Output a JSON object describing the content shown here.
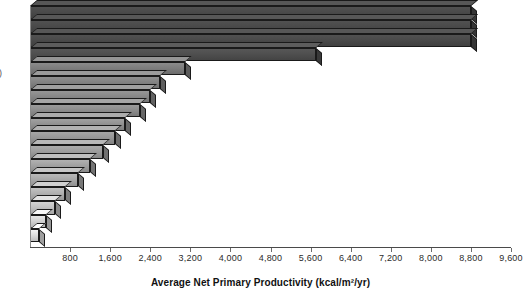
{
  "chart": {
    "type": "bar",
    "orientation": "horizontal",
    "title": "",
    "xlabel": "Average Net Primary Productivity (kcal/m²/yr)",
    "ylabel": "",
    "y_axis_label_cropped": ")",
    "xlim": [
      0,
      9600
    ],
    "xtick_step": 800,
    "grid": false,
    "legend": null
  },
  "chart_data": {
    "type": "bar",
    "orientation": "horizontal",
    "title": "",
    "xlabel": "Average Net Primary Productivity (kcal/m²/yr)",
    "ylabel": "",
    "xlim": [
      0,
      9600
    ],
    "ylim": null,
    "grid": false,
    "legend_position": "none",
    "tick_labels": [
      "800",
      "1,600",
      "2,400",
      "3,200",
      "4,000",
      "4,800",
      "5,600",
      "6,400",
      "7,200",
      "8,000",
      "8,800",
      "9,600"
    ],
    "tick_values": [
      800,
      1600,
      2400,
      3200,
      4000,
      4800,
      5600,
      6400,
      7200,
      8000,
      8800,
      9600
    ],
    "categories": [
      "",
      "",
      "",
      "",
      "",
      "",
      "",
      "",
      "",
      "",
      "",
      "",
      "",
      "",
      "",
      "",
      ""
    ],
    "values": [
      8800,
      8800,
      8800,
      5700,
      3100,
      2600,
      2400,
      2200,
      1900,
      1700,
      1450,
      1200,
      950,
      700,
      500,
      320,
      180
    ],
    "colors": [
      "#4a4a4a",
      "#4a4a4a",
      "#4a4a4a",
      "#4f4f4f",
      "#7e7e7e",
      "#838383",
      "#888888",
      "#8d8d8d",
      "#929292",
      "#979797",
      "#9c9c9c",
      "#a1a1a1",
      "#a8a8a8",
      "#b0b0b0",
      "#c0c0c0",
      "#d2d2d2",
      "#dedede"
    ],
    "bars": [
      {
        "index": 1,
        "value": 8800,
        "color": "#4a4a4a"
      },
      {
        "index": 2,
        "value": 8800,
        "color": "#4a4a4a"
      },
      {
        "index": 3,
        "value": 8800,
        "color": "#4a4a4a"
      },
      {
        "index": 4,
        "value": 5700,
        "color": "#4f4f4f"
      },
      {
        "index": 5,
        "value": 3100,
        "color": "#7e7e7e"
      },
      {
        "index": 6,
        "value": 2600,
        "color": "#838383"
      },
      {
        "index": 7,
        "value": 2400,
        "color": "#888888"
      },
      {
        "index": 8,
        "value": 2200,
        "color": "#8d8d8d"
      },
      {
        "index": 9,
        "value": 1900,
        "color": "#929292"
      },
      {
        "index": 10,
        "value": 1700,
        "color": "#979797"
      },
      {
        "index": 11,
        "value": 1450,
        "color": "#9c9c9c"
      },
      {
        "index": 12,
        "value": 1200,
        "color": "#a1a1a1"
      },
      {
        "index": 13,
        "value": 950,
        "color": "#a8a8a8"
      },
      {
        "index": 14,
        "value": 700,
        "color": "#b0b0b0"
      },
      {
        "index": 15,
        "value": 500,
        "color": "#c0c0c0"
      },
      {
        "index": 16,
        "value": 320,
        "color": "#d2d2d2"
      },
      {
        "index": 17,
        "value": 180,
        "color": "#dedede"
      }
    ]
  },
  "style": {
    "background": "#ffffff",
    "axis_color": "#4a4a4a",
    "text_color": "#2b2b2b",
    "bar_outline": "#1a1a1a"
  }
}
